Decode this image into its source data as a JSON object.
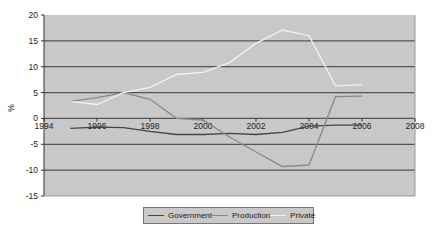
{
  "chart_data": {
    "type": "line",
    "title": "",
    "xlabel": "",
    "ylabel": "%",
    "xlim": [
      1994,
      2008
    ],
    "ylim": [
      -15,
      20
    ],
    "x_ticks": [
      1994,
      1996,
      1998,
      2000,
      2002,
      2004,
      2006,
      2008
    ],
    "y_ticks": [
      20,
      15,
      10,
      5,
      0,
      -5,
      -10,
      -15
    ],
    "grid": true,
    "legend_position": "bottom",
    "x": [
      1995,
      1996,
      1997,
      1998,
      1999,
      2000,
      2001,
      2002,
      2003,
      2004,
      2005,
      2006
    ],
    "series": [
      {
        "name": "Government",
        "color": "#444444",
        "values": [
          -1.9,
          -1.7,
          -1.8,
          -2.5,
          -3.1,
          -3.1,
          -2.9,
          -3.1,
          -2.7,
          -1.5,
          -1.3,
          -1.3
        ]
      },
      {
        "name": "Production",
        "color": "#8a8a8a",
        "values": [
          3.3,
          4.0,
          5.0,
          3.7,
          0.0,
          -0.3,
          -3.6,
          -6.5,
          -9.3,
          -9.0,
          4.2,
          4.3
        ]
      },
      {
        "name": "Private",
        "color": "#f2f2f2",
        "values": [
          3.3,
          2.7,
          5.0,
          6.0,
          8.5,
          8.9,
          10.8,
          14.5,
          17.1,
          16.0,
          6.3,
          6.5
        ]
      }
    ]
  },
  "legend": {
    "items": [
      {
        "label": "Government",
        "color": "#444444"
      },
      {
        "label": "Production",
        "color": "#8a8a8a"
      },
      {
        "label": "Private",
        "color": "#f2f2f2"
      }
    ]
  },
  "colors": {
    "plot_bg": "#c8c8c8",
    "grid": "#555555",
    "axis": "#333333"
  }
}
